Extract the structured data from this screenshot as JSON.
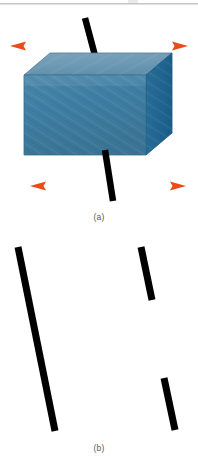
{
  "figure": {
    "type": "physics-diagram",
    "width": 198,
    "height": 470,
    "background": "#ffffff",
    "top_rule_color": "#c4c4c4"
  },
  "panels": [
    {
      "id": "a",
      "caption": "(a)",
      "block": {
        "shape": "rectangular-prism",
        "front_face_color": "#3f7ea2",
        "top_face_color": "#6e9ab4",
        "side_face_color": "#1d6490",
        "edge_color": "#2a5d7d",
        "front": {
          "x": 24,
          "y": 75,
          "w": 122,
          "h": 80
        },
        "depth_x": 26,
        "depth_y": -22
      },
      "rod": {
        "color": "#000000",
        "thickness": 6,
        "x1": 85,
        "y1": 18,
        "x2": 113,
        "y2": 200
      },
      "arrows": [
        {
          "name": "top-left-arrow",
          "direction": "left",
          "color": "#ed5b2a",
          "x_tip": 10,
          "x_tail": 88,
          "y": 46
        },
        {
          "name": "top-right-arrow",
          "direction": "right",
          "color": "#ed5b2a",
          "x_tip": 188,
          "x_tail": 110,
          "y": 46
        },
        {
          "name": "bottom-left-arrow",
          "direction": "left",
          "color": "#ed5b2a",
          "x_tip": 30,
          "x_tail": 100,
          "y": 186
        },
        {
          "name": "bottom-right-arrow",
          "direction": "right",
          "color": "#ed5b2a",
          "x_tip": 186,
          "x_tail": 118,
          "y": 186
        }
      ]
    },
    {
      "id": "b",
      "caption": "(b)",
      "segments": [
        {
          "name": "left-long-segment",
          "color": "#000000",
          "thickness": 7,
          "x1": 18,
          "y1": 247,
          "x2": 55,
          "y2": 431
        },
        {
          "name": "right-upper-segment",
          "color": "#000000",
          "thickness": 7,
          "x1": 141,
          "y1": 247,
          "x2": 152,
          "y2": 300
        },
        {
          "name": "right-lower-segment",
          "color": "#000000",
          "thickness": 7,
          "x1": 164,
          "y1": 378,
          "x2": 175,
          "y2": 430
        }
      ]
    }
  ],
  "colors": {
    "arrow_orange": "#ed5b2a",
    "block_blue": "#3f7ea2",
    "block_blue_top": "#6e9ab4",
    "block_blue_side": "#1d6490",
    "rod_black": "#000000",
    "caption_gray": "#5a5a5a"
  }
}
